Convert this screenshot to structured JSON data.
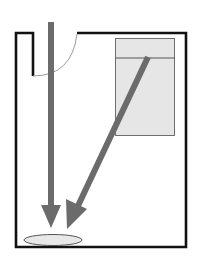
{
  "diagram": {
    "type": "floor-plan",
    "elements": {
      "room": "room-walls",
      "door": "door-swing",
      "cabinet": "cabinet-with-header-section",
      "arrows": [
        "vertical-arrow-from-door",
        "diagonal-arrow-from-cabinet"
      ],
      "target": "floor-spot-ellipse"
    },
    "colors": {
      "wall": "#111111",
      "arrow": "#6b6b6b",
      "cabinet_fill": "#e6e6e6",
      "cabinet_stroke": "#6e6e6e",
      "ellipse_fill": "#e8e8e8",
      "ellipse_stroke": "#555555",
      "door_arc": "#9a9a9a"
    }
  }
}
